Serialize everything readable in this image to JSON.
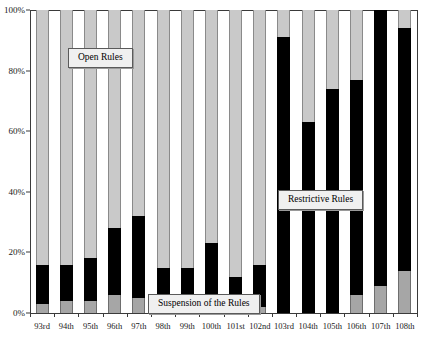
{
  "chart_data": {
    "type": "bar",
    "subtype": "stacked-100-percent",
    "title": "",
    "subtitle": "",
    "xlabel": "",
    "ylabel": "",
    "ylim": [
      0,
      100
    ],
    "ytick_labels": [
      "0%",
      "20%",
      "40%",
      "60%",
      "80%",
      "100%"
    ],
    "ytick_values": [
      0,
      20,
      40,
      60,
      80,
      100
    ],
    "grid": false,
    "legend": "inline-callouts",
    "categories": [
      "93rd",
      "94th",
      "95th",
      "96th",
      "97th",
      "98th",
      "99th",
      "100th",
      "101st",
      "102nd",
      "103rd",
      "104th",
      "105th",
      "106th",
      "107th",
      "108th"
    ],
    "series": [
      {
        "name": "Suspension of the Rules",
        "color": "#a6a6a6",
        "values": [
          3,
          4,
          4,
          6,
          5,
          2,
          1,
          1,
          1,
          2,
          0,
          0,
          0,
          6,
          9,
          14
        ]
      },
      {
        "name": "Restrictive Rules",
        "color": "#000000",
        "values": [
          13,
          12,
          14,
          22,
          27,
          13,
          14,
          22,
          11,
          14,
          91,
          63,
          74,
          71,
          91,
          80
        ]
      },
      {
        "name": "Open Rules",
        "color": "#c9c9c9",
        "values": [
          84,
          84,
          82,
          72,
          68,
          85,
          85,
          77,
          88,
          84,
          9,
          37,
          26,
          23,
          0,
          6
        ]
      }
    ],
    "cumulative_tops": {
      "suspension": [
        3,
        4,
        4,
        6,
        5,
        2,
        1,
        1,
        1,
        2,
        0,
        0,
        0,
        6,
        9,
        14
      ],
      "restrictive": [
        16,
        16,
        18,
        28,
        32,
        15,
        15,
        23,
        12,
        16,
        91,
        63,
        74,
        77,
        100,
        94
      ]
    },
    "annotations": [
      {
        "name": "open-rules-callout",
        "text": "Open Rules"
      },
      {
        "name": "suspension-callout",
        "text": "Suspension of the Rules"
      },
      {
        "name": "restrictive-callout",
        "text": "Restrictive Rules"
      }
    ]
  },
  "labels": {
    "open_rules": "Open Rules",
    "suspension_of_the_rules": "Suspension of the Rules",
    "restrictive_rules": "Restrictive Rules"
  }
}
